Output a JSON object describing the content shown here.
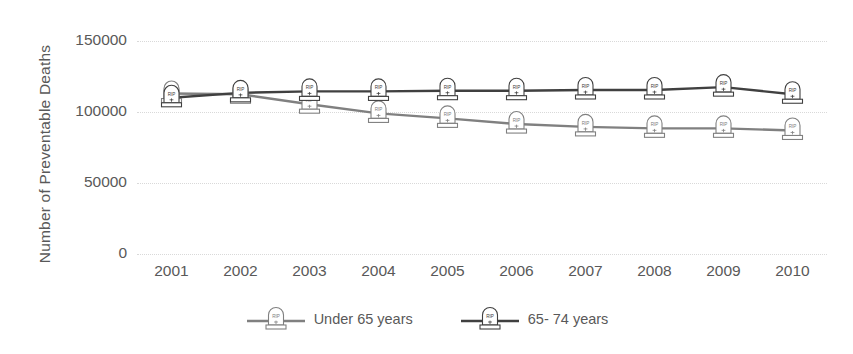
{
  "chart_data": {
    "type": "line",
    "title": "",
    "xlabel": "",
    "ylabel": "Number of Preventable Deaths",
    "categories": [
      "2001",
      "2002",
      "2003",
      "2004",
      "2005",
      "2006",
      "2007",
      "2008",
      "2009",
      "2010"
    ],
    "yticks": [
      0,
      50000,
      100000,
      150000
    ],
    "ytick_labels": [
      "0",
      "50000",
      "100000",
      "150000"
    ],
    "ylim": [
      0,
      150000
    ],
    "grid": true,
    "legend_position": "bottom",
    "marker_style": "tombstone-rip",
    "series": [
      {
        "name": "Under 65 years",
        "color": "#808080",
        "marker": "tombstone-icon",
        "values": [
          113000,
          112500,
          105500,
          99000,
          95500,
          91500,
          89500,
          88500,
          88500,
          87000
        ]
      },
      {
        "name": "65- 74 years",
        "color": "#404040",
        "marker": "tombstone-icon",
        "values": [
          110000,
          113500,
          114500,
          114500,
          115000,
          115000,
          115500,
          115500,
          117500,
          112500
        ]
      }
    ]
  },
  "legend": {
    "items": [
      {
        "label": "Under 65 years"
      },
      {
        "label": "65- 74 years"
      }
    ]
  }
}
